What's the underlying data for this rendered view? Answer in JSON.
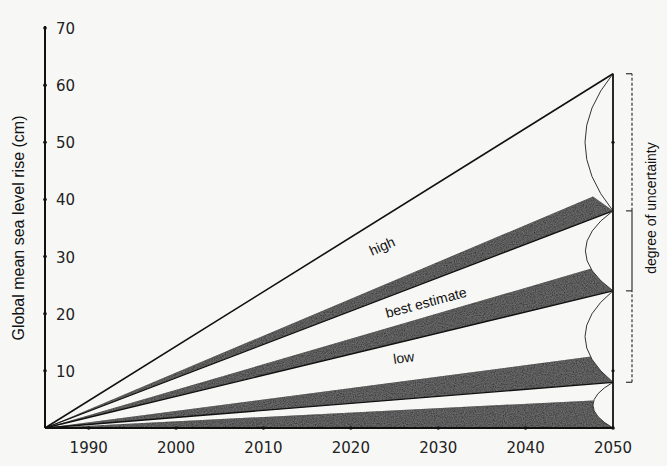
{
  "chart_data": {
    "type": "area",
    "title": "",
    "xlabel": "",
    "ylabel": "Global mean sea level rise (cm)",
    "xlim": [
      1985,
      2050
    ],
    "ylim": [
      0,
      70
    ],
    "x_ticks": [
      1990,
      2000,
      2010,
      2020,
      2030,
      2040,
      2050
    ],
    "y_ticks": [
      10,
      20,
      30,
      40,
      50,
      60,
      70
    ],
    "grid": false,
    "legend": null,
    "start_year": 1985,
    "end_year": 2050,
    "series": [
      {
        "name": "high",
        "values_2050": 62,
        "type": "line"
      },
      {
        "name": "band-upper",
        "values_2050": [
          38,
          42
        ],
        "type": "shaded-band"
      },
      {
        "name": "best estimate",
        "values_2050": [
          24,
          29
        ],
        "type": "shaded-band"
      },
      {
        "name": "band-lower-mid",
        "values_2050": [
          8,
          13
        ],
        "type": "shaded-band"
      },
      {
        "name": "low",
        "values_2050": [
          0,
          5
        ],
        "type": "shaded-band"
      }
    ],
    "scenario_lines_2050": [
      62,
      38,
      24,
      8,
      0
    ],
    "annotations": {
      "high": "high",
      "best_estimate": "best estimate",
      "low": "low",
      "uncertainty": "degree of uncertainty"
    },
    "uncertainty_bracket": {
      "dashed_upper": [
        38,
        62
      ],
      "solid": [
        24,
        38
      ],
      "dashed_lower": [
        8,
        24
      ]
    }
  },
  "colors": {
    "ink": "#111111",
    "band": "#1a1a1a",
    "background": "#f7f7f5"
  }
}
